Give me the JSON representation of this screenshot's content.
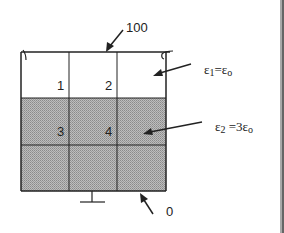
{
  "diagram": {
    "title": "",
    "boundary": {
      "top_potential": "100",
      "bottom_potential": "0"
    },
    "grid": {
      "rows": 3,
      "cols": 3,
      "node_labels": [
        "1",
        "2",
        "3",
        "4"
      ]
    },
    "regions": [
      {
        "name": "upper",
        "label_main": "ε",
        "label_sub": "1",
        "label_rest": "=ε",
        "label_sub2": "o",
        "fill": "#ffffff"
      },
      {
        "name": "lower",
        "label_main": "ε",
        "label_sub": "2",
        "label_rest": " =3ε",
        "label_sub2": "o",
        "fill": "#a8a8a8"
      }
    ],
    "colors": {
      "line": "#222222",
      "shade": "#a8a8a8",
      "background": "#ffffff"
    }
  }
}
